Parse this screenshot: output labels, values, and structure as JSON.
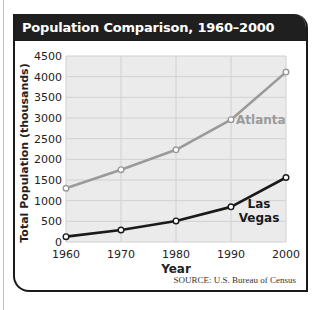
{
  "title": "Population Comparison, 1960–2000",
  "source": "SOURCE: U.S. Bureau of Census",
  "colors": {
    "header_bg": "#1f1f1f",
    "plot_bg": "#ebebeb",
    "grid": "#d0d0d0",
    "atlanta_line": "#9a9a9a",
    "las_vegas_line": "#1a1a1a",
    "marker_fill": "#ffffff"
  },
  "chart_data": {
    "type": "line",
    "title": "Population Comparison, 1960–2000",
    "xlabel": "Year",
    "ylabel": "Total Population (thousands)",
    "x": [
      1960,
      1970,
      1980,
      1990,
      2000
    ],
    "x_tick_labels": [
      "1960",
      "1970",
      "1980",
      "1990",
      "2000"
    ],
    "y_tick_labels": [
      "0",
      "500",
      "1000",
      "1500",
      "2000",
      "2500",
      "3000",
      "3500",
      "4000",
      "4500"
    ],
    "ylim": [
      0,
      4500
    ],
    "grid": true,
    "legend": "inline labels next to lines",
    "series": [
      {
        "name": "Atlanta",
        "values": [
          1300,
          1750,
          2230,
          2960,
          4110
        ]
      },
      {
        "name": "Las Vegas",
        "label_lines": [
          "Las",
          "Vegas"
        ],
        "values": [
          130,
          290,
          510,
          850,
          1560
        ]
      }
    ],
    "source": "SOURCE: U.S. Bureau of Census"
  }
}
